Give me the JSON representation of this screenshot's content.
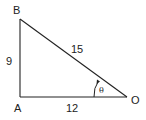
{
  "diagram": {
    "type": "right-triangle",
    "vertices": {
      "A": {
        "label": "A",
        "x": 20,
        "y": 97
      },
      "B": {
        "label": "B",
        "x": 20,
        "y": 19
      },
      "O": {
        "label": "O",
        "x": 127,
        "y": 97
      }
    },
    "sides": {
      "AB": {
        "label": "9"
      },
      "AO": {
        "label": "12"
      },
      "BO": {
        "label": "15"
      }
    },
    "angle": {
      "label": "θ",
      "at": "O"
    },
    "stroke_color": "#222222"
  }
}
